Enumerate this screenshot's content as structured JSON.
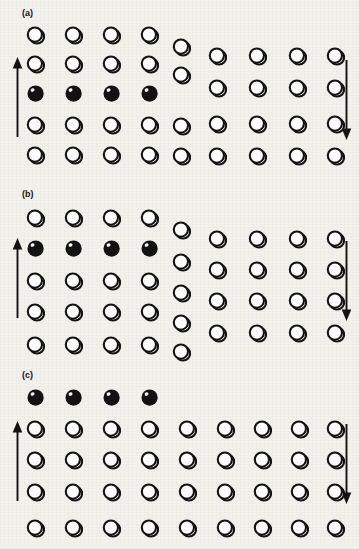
{
  "figure": {
    "background_color": "#f3f1ed",
    "ink_color": "#111111",
    "atom_open_fill": "#ffffff",
    "atom_solid_fill": "#111111",
    "atom_diameter_px": 19
  },
  "legend": {
    "open_atom_name": "open-atom",
    "solid_atom_name": "solid-atom",
    "up_arrow_name": "shear-arrow-up",
    "down_arrow_name": "shear-arrow-down"
  },
  "panels": [
    {
      "id": "a",
      "label": "(a)",
      "label_x": 22,
      "label_y": 8,
      "top": 0,
      "height": 185,
      "caption_state": "dislocation at left, extra half-plane inserted",
      "arrows": [
        {
          "name": "shear-arrow-up",
          "direction": "up",
          "x": 11,
          "y": 57,
          "length": 80
        },
        {
          "name": "shear-arrow-down",
          "direction": "down",
          "x": 340,
          "y": 60,
          "length": 80
        }
      ],
      "atoms": [
        {
          "col": 1,
          "row": 1,
          "x": 26,
          "y": 26,
          "fill": "open"
        },
        {
          "col": 1,
          "row": 2,
          "x": 26,
          "y": 55,
          "fill": "open"
        },
        {
          "col": 1,
          "row": 3,
          "x": 26,
          "y": 84,
          "fill": "solid"
        },
        {
          "col": 1,
          "row": 4,
          "x": 26,
          "y": 116,
          "fill": "open"
        },
        {
          "col": 1,
          "row": 5,
          "x": 26,
          "y": 146,
          "fill": "open"
        },
        {
          "col": 2,
          "row": 1,
          "x": 64,
          "y": 26,
          "fill": "open"
        },
        {
          "col": 2,
          "row": 2,
          "x": 64,
          "y": 55,
          "fill": "open"
        },
        {
          "col": 2,
          "row": 3,
          "x": 64,
          "y": 84,
          "fill": "solid"
        },
        {
          "col": 2,
          "row": 4,
          "x": 64,
          "y": 116,
          "fill": "open"
        },
        {
          "col": 2,
          "row": 5,
          "x": 64,
          "y": 146,
          "fill": "open"
        },
        {
          "col": 3,
          "row": 1,
          "x": 102,
          "y": 26,
          "fill": "open"
        },
        {
          "col": 3,
          "row": 2,
          "x": 102,
          "y": 55,
          "fill": "open"
        },
        {
          "col": 3,
          "row": 3,
          "x": 102,
          "y": 84,
          "fill": "solid"
        },
        {
          "col": 3,
          "row": 4,
          "x": 102,
          "y": 116,
          "fill": "open"
        },
        {
          "col": 3,
          "row": 5,
          "x": 102,
          "y": 146,
          "fill": "open"
        },
        {
          "col": 4,
          "row": 1,
          "x": 140,
          "y": 26,
          "fill": "open"
        },
        {
          "col": 4,
          "row": 2,
          "x": 140,
          "y": 55,
          "fill": "open"
        },
        {
          "col": 4,
          "row": 3,
          "x": 140,
          "y": 84,
          "fill": "solid"
        },
        {
          "col": 4,
          "row": 4,
          "x": 140,
          "y": 116,
          "fill": "open"
        },
        {
          "col": 4,
          "row": 5,
          "x": 140,
          "y": 146,
          "fill": "open"
        },
        {
          "col": 5,
          "row": 1,
          "x": 172,
          "y": 38,
          "fill": "open"
        },
        {
          "col": 5,
          "row": 2,
          "x": 172,
          "y": 66,
          "fill": "open"
        },
        {
          "col": 5,
          "row": 4,
          "x": 172,
          "y": 117,
          "fill": "open"
        },
        {
          "col": 5,
          "row": 5,
          "x": 172,
          "y": 147,
          "fill": "open"
        },
        {
          "col": 6,
          "row": 1,
          "x": 208,
          "y": 47,
          "fill": "open"
        },
        {
          "col": 6,
          "row": 2,
          "x": 208,
          "y": 79,
          "fill": "open"
        },
        {
          "col": 6,
          "row": 3,
          "x": 208,
          "y": 115,
          "fill": "open"
        },
        {
          "col": 6,
          "row": 4,
          "x": 208,
          "y": 147,
          "fill": "open"
        },
        {
          "col": 7,
          "row": 1,
          "x": 248,
          "y": 47,
          "fill": "open"
        },
        {
          "col": 7,
          "row": 2,
          "x": 248,
          "y": 79,
          "fill": "open"
        },
        {
          "col": 7,
          "row": 3,
          "x": 248,
          "y": 115,
          "fill": "open"
        },
        {
          "col": 7,
          "row": 4,
          "x": 248,
          "y": 147,
          "fill": "open"
        },
        {
          "col": 8,
          "row": 1,
          "x": 288,
          "y": 47,
          "fill": "open"
        },
        {
          "col": 8,
          "row": 2,
          "x": 288,
          "y": 79,
          "fill": "open"
        },
        {
          "col": 8,
          "row": 3,
          "x": 288,
          "y": 115,
          "fill": "open"
        },
        {
          "col": 8,
          "row": 4,
          "x": 288,
          "y": 147,
          "fill": "open"
        },
        {
          "col": 9,
          "row": 1,
          "x": 326,
          "y": 47,
          "fill": "open"
        },
        {
          "col": 9,
          "row": 2,
          "x": 326,
          "y": 79,
          "fill": "open"
        },
        {
          "col": 9,
          "row": 3,
          "x": 326,
          "y": 115,
          "fill": "open"
        },
        {
          "col": 9,
          "row": 4,
          "x": 326,
          "y": 147,
          "fill": "open"
        }
      ]
    },
    {
      "id": "b",
      "label": "(b)",
      "label_x": 22,
      "label_y": 189,
      "top": 181,
      "height": 184,
      "caption_state": "dislocation glided one lattice step to the right",
      "arrows": [
        {
          "name": "shear-arrow-up",
          "direction": "up",
          "x": 11,
          "y": 238,
          "length": 80
        },
        {
          "name": "shear-arrow-down",
          "direction": "down",
          "x": 340,
          "y": 241,
          "length": 80
        }
      ],
      "atoms": [
        {
          "col": 1,
          "row": 1,
          "x": 26,
          "y": 209,
          "fill": "open"
        },
        {
          "col": 1,
          "row": 2,
          "x": 26,
          "y": 239,
          "fill": "solid"
        },
        {
          "col": 1,
          "row": 3,
          "x": 26,
          "y": 272,
          "fill": "open"
        },
        {
          "col": 1,
          "row": 4,
          "x": 26,
          "y": 303,
          "fill": "open"
        },
        {
          "col": 1,
          "row": 5,
          "x": 26,
          "y": 336,
          "fill": "open"
        },
        {
          "col": 2,
          "row": 1,
          "x": 64,
          "y": 209,
          "fill": "open"
        },
        {
          "col": 2,
          "row": 2,
          "x": 64,
          "y": 239,
          "fill": "solid"
        },
        {
          "col": 2,
          "row": 3,
          "x": 64,
          "y": 272,
          "fill": "open"
        },
        {
          "col": 2,
          "row": 4,
          "x": 64,
          "y": 303,
          "fill": "open"
        },
        {
          "col": 2,
          "row": 5,
          "x": 64,
          "y": 336,
          "fill": "open"
        },
        {
          "col": 3,
          "row": 1,
          "x": 102,
          "y": 209,
          "fill": "open"
        },
        {
          "col": 3,
          "row": 2,
          "x": 102,
          "y": 239,
          "fill": "solid"
        },
        {
          "col": 3,
          "row": 3,
          "x": 102,
          "y": 272,
          "fill": "open"
        },
        {
          "col": 3,
          "row": 4,
          "x": 102,
          "y": 303,
          "fill": "open"
        },
        {
          "col": 3,
          "row": 5,
          "x": 102,
          "y": 336,
          "fill": "open"
        },
        {
          "col": 4,
          "row": 1,
          "x": 140,
          "y": 209,
          "fill": "open"
        },
        {
          "col": 4,
          "row": 2,
          "x": 140,
          "y": 239,
          "fill": "solid"
        },
        {
          "col": 4,
          "row": 3,
          "x": 140,
          "y": 272,
          "fill": "open"
        },
        {
          "col": 4,
          "row": 4,
          "x": 140,
          "y": 303,
          "fill": "open"
        },
        {
          "col": 4,
          "row": 5,
          "x": 140,
          "y": 336,
          "fill": "open"
        },
        {
          "col": 5,
          "row": 1,
          "x": 172,
          "y": 221,
          "fill": "open"
        },
        {
          "col": 5,
          "row": 2,
          "x": 172,
          "y": 253,
          "fill": "open"
        },
        {
          "col": 5,
          "row": 3,
          "x": 172,
          "y": 284,
          "fill": "open"
        },
        {
          "col": 5,
          "row": 4,
          "x": 172,
          "y": 314,
          "fill": "open"
        },
        {
          "col": 5,
          "row": 5,
          "x": 172,
          "y": 343,
          "fill": "open"
        },
        {
          "col": 6,
          "row": 1,
          "x": 208,
          "y": 230,
          "fill": "open"
        },
        {
          "col": 6,
          "row": 2,
          "x": 208,
          "y": 261,
          "fill": "open"
        },
        {
          "col": 6,
          "row": 3,
          "x": 208,
          "y": 292,
          "fill": "open"
        },
        {
          "col": 6,
          "row": 4,
          "x": 208,
          "y": 324,
          "fill": "open"
        },
        {
          "col": 7,
          "row": 1,
          "x": 248,
          "y": 230,
          "fill": "open"
        },
        {
          "col": 7,
          "row": 2,
          "x": 248,
          "y": 261,
          "fill": "open"
        },
        {
          "col": 7,
          "row": 3,
          "x": 248,
          "y": 292,
          "fill": "open"
        },
        {
          "col": 7,
          "row": 4,
          "x": 248,
          "y": 324,
          "fill": "open"
        },
        {
          "col": 8,
          "row": 1,
          "x": 288,
          "y": 230,
          "fill": "open"
        },
        {
          "col": 8,
          "row": 2,
          "x": 288,
          "y": 261,
          "fill": "open"
        },
        {
          "col": 8,
          "row": 3,
          "x": 288,
          "y": 292,
          "fill": "open"
        },
        {
          "col": 8,
          "row": 4,
          "x": 288,
          "y": 324,
          "fill": "open"
        },
        {
          "col": 9,
          "row": 1,
          "x": 326,
          "y": 230,
          "fill": "open"
        },
        {
          "col": 9,
          "row": 2,
          "x": 326,
          "y": 261,
          "fill": "open"
        },
        {
          "col": 9,
          "row": 3,
          "x": 326,
          "y": 292,
          "fill": "open"
        },
        {
          "col": 9,
          "row": 4,
          "x": 326,
          "y": 324,
          "fill": "open"
        }
      ]
    },
    {
      "id": "c",
      "label": "(c)",
      "label_x": 22,
      "label_y": 370,
      "top": 362,
      "height": 187,
      "caption_state": "dislocation has run out, leaving a surface step",
      "arrows": [
        {
          "name": "shear-arrow-up",
          "direction": "up",
          "x": 11,
          "y": 421,
          "length": 80
        },
        {
          "name": "shear-arrow-down",
          "direction": "down",
          "x": 340,
          "y": 424,
          "length": 80
        }
      ],
      "atoms": [
        {
          "col": 1,
          "row": 0,
          "x": 26,
          "y": 388,
          "fill": "solid"
        },
        {
          "col": 2,
          "row": 0,
          "x": 64,
          "y": 388,
          "fill": "solid"
        },
        {
          "col": 3,
          "row": 0,
          "x": 102,
          "y": 388,
          "fill": "solid"
        },
        {
          "col": 4,
          "row": 0,
          "x": 140,
          "y": 388,
          "fill": "solid"
        },
        {
          "col": 1,
          "row": 1,
          "x": 26,
          "y": 420,
          "fill": "open"
        },
        {
          "col": 2,
          "row": 1,
          "x": 64,
          "y": 420,
          "fill": "open"
        },
        {
          "col": 3,
          "row": 1,
          "x": 102,
          "y": 420,
          "fill": "open"
        },
        {
          "col": 4,
          "row": 1,
          "x": 140,
          "y": 420,
          "fill": "open"
        },
        {
          "col": 5,
          "row": 1,
          "x": 178,
          "y": 420,
          "fill": "open"
        },
        {
          "col": 6,
          "row": 1,
          "x": 216,
          "y": 420,
          "fill": "open"
        },
        {
          "col": 7,
          "row": 1,
          "x": 253,
          "y": 420,
          "fill": "open"
        },
        {
          "col": 8,
          "row": 1,
          "x": 290,
          "y": 420,
          "fill": "open"
        },
        {
          "col": 9,
          "row": 1,
          "x": 326,
          "y": 420,
          "fill": "open"
        },
        {
          "col": 1,
          "row": 2,
          "x": 26,
          "y": 451,
          "fill": "open"
        },
        {
          "col": 2,
          "row": 2,
          "x": 64,
          "y": 451,
          "fill": "open"
        },
        {
          "col": 3,
          "row": 2,
          "x": 102,
          "y": 451,
          "fill": "open"
        },
        {
          "col": 4,
          "row": 2,
          "x": 140,
          "y": 451,
          "fill": "open"
        },
        {
          "col": 5,
          "row": 2,
          "x": 178,
          "y": 451,
          "fill": "open"
        },
        {
          "col": 6,
          "row": 2,
          "x": 216,
          "y": 451,
          "fill": "open"
        },
        {
          "col": 7,
          "row": 2,
          "x": 253,
          "y": 451,
          "fill": "open"
        },
        {
          "col": 8,
          "row": 2,
          "x": 290,
          "y": 451,
          "fill": "open"
        },
        {
          "col": 9,
          "row": 2,
          "x": 326,
          "y": 451,
          "fill": "open"
        },
        {
          "col": 1,
          "row": 3,
          "x": 26,
          "y": 483,
          "fill": "open"
        },
        {
          "col": 2,
          "row": 3,
          "x": 64,
          "y": 483,
          "fill": "open"
        },
        {
          "col": 3,
          "row": 3,
          "x": 102,
          "y": 483,
          "fill": "open"
        },
        {
          "col": 4,
          "row": 3,
          "x": 140,
          "y": 483,
          "fill": "open"
        },
        {
          "col": 5,
          "row": 3,
          "x": 178,
          "y": 483,
          "fill": "open"
        },
        {
          "col": 6,
          "row": 3,
          "x": 216,
          "y": 483,
          "fill": "open"
        },
        {
          "col": 7,
          "row": 3,
          "x": 253,
          "y": 483,
          "fill": "open"
        },
        {
          "col": 8,
          "row": 3,
          "x": 290,
          "y": 483,
          "fill": "open"
        },
        {
          "col": 9,
          "row": 3,
          "x": 326,
          "y": 483,
          "fill": "open"
        },
        {
          "col": 1,
          "row": 4,
          "x": 26,
          "y": 519,
          "fill": "open"
        },
        {
          "col": 2,
          "row": 4,
          "x": 64,
          "y": 519,
          "fill": "open"
        },
        {
          "col": 3,
          "row": 4,
          "x": 102,
          "y": 519,
          "fill": "open"
        },
        {
          "col": 4,
          "row": 4,
          "x": 140,
          "y": 519,
          "fill": "open"
        },
        {
          "col": 5,
          "row": 4,
          "x": 178,
          "y": 519,
          "fill": "open"
        },
        {
          "col": 6,
          "row": 4,
          "x": 216,
          "y": 519,
          "fill": "open"
        },
        {
          "col": 7,
          "row": 4,
          "x": 253,
          "y": 519,
          "fill": "open"
        },
        {
          "col": 8,
          "row": 4,
          "x": 290,
          "y": 519,
          "fill": "open"
        },
        {
          "col": 9,
          "row": 4,
          "x": 326,
          "y": 519,
          "fill": "open"
        }
      ]
    }
  ]
}
